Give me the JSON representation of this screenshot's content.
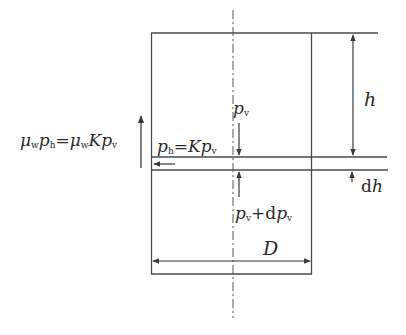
{
  "diagram": {
    "type": "free-body diagram of cylindrical silo element (Janssen)",
    "colors": {
      "line": "#4a4a4a",
      "text": "#2a2a2a",
      "background": "#ffffff"
    },
    "labels": {
      "height": {
        "var": "h"
      },
      "slice_thickness": {
        "prefix": "d",
        "var": "h"
      },
      "diameter": {
        "var": "D"
      },
      "vertical_pressure_top": {
        "var": "p",
        "sub": "v"
      },
      "vertical_pressure_bottom": {
        "var1": "p",
        "sub1": "v",
        "op": "+d",
        "var2": "p",
        "sub2": "v"
      },
      "horizontal_pressure": {
        "var1": "p",
        "sub1": "h",
        "eq": "=",
        "coef": "K",
        "var2": "p",
        "sub2": "v"
      },
      "wall_friction": {
        "mu1": "μ",
        "musub1": "w",
        "var1": "p",
        "sub1": "h",
        "eq": "=",
        "mu2": "μ",
        "musub2": "w",
        "coef": "K",
        "var2": "p",
        "sub2": "v"
      }
    }
  }
}
